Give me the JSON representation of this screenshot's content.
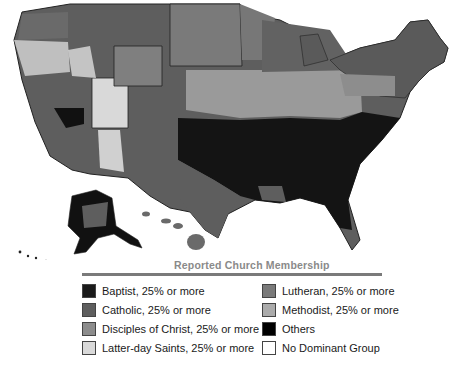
{
  "map": {
    "title": "Reported Church Membership",
    "type": "choropleth",
    "region": "United States counties, including Alaska and Hawaii"
  },
  "legend": {
    "title": "Reported Church Membership",
    "items": [
      {
        "label": "Baptist, 25% or more",
        "color": "#1a1a1a"
      },
      {
        "label": "Catholic, 25% or more",
        "color": "#5e5e5e"
      },
      {
        "label": "Disciples of Christ, 25% or more",
        "color": "#8c8c8c"
      },
      {
        "label": "Latter-day Saints, 25% or more",
        "color": "#d9d9d9"
      },
      {
        "label": "Lutheran, 25% or more",
        "color": "#7a7a7a"
      },
      {
        "label": "Methodist, 25% or more",
        "color": "#ababab"
      },
      {
        "label": "Others",
        "color": "#000000"
      },
      {
        "label": "No Dominant Group",
        "color": "#ffffff"
      }
    ]
  }
}
